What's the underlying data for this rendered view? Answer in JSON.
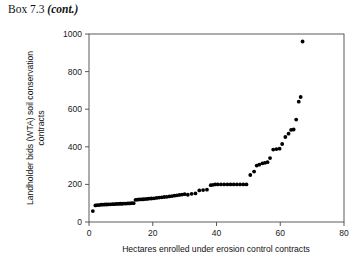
{
  "box": {
    "label": "Box 7.3",
    "cont": "(cont.)"
  },
  "chart_data": {
    "type": "scatter",
    "title": "",
    "xlabel": "Hectares enrolled under erosion control contracts",
    "ylabel": "Landholder bids (WTA) soil conservation contracts",
    "ylabel_line1": "Landholder bids (WTA) soil conservation",
    "ylabel_line2": "contracts",
    "xlim": [
      0,
      80
    ],
    "ylim": [
      0,
      1000
    ],
    "xticks": [
      0,
      20,
      40,
      60,
      80
    ],
    "yticks": [
      0,
      200,
      400,
      600,
      800,
      1000
    ],
    "grid": false,
    "legend": null,
    "marker": "filled-circle",
    "marker_color": "#000000",
    "series": [
      {
        "name": "Landholder bids",
        "x": [
          1.2,
          2.0,
          2.6,
          3.2,
          3.8,
          4.4,
          5.0,
          5.6,
          6.2,
          6.8,
          7.4,
          8.0,
          8.6,
          9.2,
          9.8,
          10.4,
          11.0,
          11.6,
          12.2,
          12.8,
          13.4,
          14.0,
          14.6,
          15.2,
          15.8,
          16.4,
          17.0,
          17.6,
          18.2,
          18.8,
          19.6,
          20.4,
          21.2,
          22.0,
          22.8,
          23.6,
          24.4,
          25.2,
          26.0,
          26.8,
          27.6,
          28.4,
          29.2,
          30.0,
          31.0,
          32.2,
          33.4,
          34.6,
          35.8,
          37.0,
          38.2,
          38.9,
          39.6,
          40.4,
          41.4,
          42.4,
          43.4,
          44.4,
          45.4,
          46.4,
          47.4,
          48.4,
          49.4,
          50.6,
          51.8,
          52.6,
          53.4,
          54.4,
          55.2,
          56.0,
          56.8,
          57.8,
          58.8,
          59.8,
          60.6,
          61.6,
          62.6,
          63.4,
          64.2,
          65.0,
          65.8,
          66.4,
          67.0
        ],
        "y": [
          58,
          88,
          90,
          90,
          92,
          92,
          93,
          93,
          94,
          94,
          95,
          95,
          96,
          96,
          97,
          97,
          98,
          98,
          99,
          99,
          100,
          100,
          118,
          119,
          120,
          120,
          121,
          122,
          123,
          124,
          125,
          126,
          128,
          130,
          131,
          133,
          134,
          136,
          138,
          140,
          142,
          144,
          146,
          148,
          145,
          150,
          152,
          168,
          170,
          172,
          196,
          198,
          200,
          200,
          200,
          200,
          200,
          200,
          200,
          200,
          200,
          200,
          200,
          250,
          268,
          300,
          305,
          312,
          315,
          318,
          340,
          385,
          388,
          390,
          415,
          452,
          470,
          490,
          492,
          545,
          640,
          665,
          960
        ]
      }
    ]
  }
}
